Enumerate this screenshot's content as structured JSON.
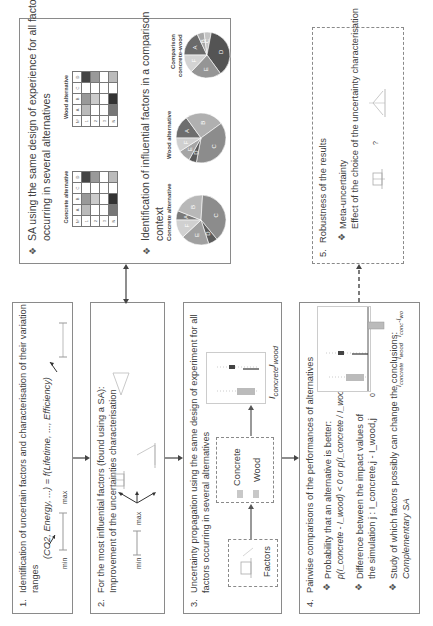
{
  "steps": [
    {
      "number": "1.",
      "title_line1": "Identification of uncertain factors and characterisation of their variation",
      "title_line2": "ranges",
      "formula": "(CO2, Energy, ...) = f(Lifetime, ..., Efficiency)",
      "range_min": "min",
      "range_max": "max"
    },
    {
      "number": "2.",
      "title_line1": "For the most influential factors (found using a SA):",
      "title_line2": "Improvement of the uncertainties characterisation",
      "range_min": "min",
      "range_max": "max"
    },
    {
      "number": "3.",
      "title_line1": "Uncertainty propagation using the same design of experiment for all",
      "title_line2": "factors occurring in several alternatives",
      "factors_label": "Factors",
      "alternatives": [
        "Concrete",
        "Wood"
      ],
      "output_labels": [
        "I_concrete",
        "I_wood"
      ],
      "output_main": [
        "I",
        "I"
      ],
      "output_sub": [
        "concrete",
        "wood"
      ]
    },
    {
      "number": "4.",
      "title": "Pairwise comparisons of the performances of alternatives",
      "bullets": [
        {
          "line1": "Probability that an alternative is better:",
          "line2": "p(I_concrete - I_wood) < 0   or   p(I_concrete / I_wood) < 1"
        },
        {
          "line1": "Difference between the impact values of",
          "line2": "the simulation j : I_concrete,j - I_wood,j"
        },
        {
          "line1": "Study of which factors possibly can change the conclusions:",
          "line2": "Complementary SA"
        }
      ],
      "chart_zero": "0",
      "chart_labels": {
        "a_main": "I",
        "a_sub": "concrete",
        "b_main": "I",
        "b_sub": "wood",
        "c_main": "I",
        "c_sub1": "conc",
        "c_mid": "-I",
        "c_sub2": "wo"
      }
    },
    {
      "number": "5.",
      "title": "Robustness of the results",
      "bullet_line1": "Meta-uncertainty",
      "bullet_line2": "Effect of the choice of the uncertainty characterisation",
      "question": "?"
    }
  ],
  "sa_box": {
    "bullet1_line1": "SA using the same design of experience for all factors",
    "bullet1_line2": "occurring in several alternatives",
    "bullet2_line1": "Identification of influential factors in a comparison",
    "bullet2_line2": "context",
    "tables": [
      {
        "caption": "Concrete alternative",
        "header": [
          "N°",
          "A",
          "B",
          "C",
          "D"
        ],
        "rows": [
          [
            "1",
            "",
            "",
            "",
            ""
          ],
          [
            "2",
            "",
            "",
            "",
            ""
          ],
          [
            "3",
            "",
            "",
            "",
            ""
          ],
          [
            "4",
            "",
            "",
            "",
            ""
          ],
          [
            "N",
            "",
            "",
            "",
            ""
          ]
        ]
      },
      {
        "caption": "Wood alternative",
        "header": [
          "N°",
          "A",
          "B",
          "C",
          "D"
        ],
        "rows": [
          [
            "1",
            "",
            "",
            "",
            ""
          ],
          [
            "2",
            "",
            "",
            "",
            ""
          ],
          [
            "3",
            "",
            "",
            "",
            ""
          ],
          [
            "4",
            "",
            "",
            "",
            ""
          ],
          [
            "N",
            "",
            "",
            "",
            ""
          ]
        ]
      }
    ],
    "pies": [
      {
        "caption": "Concrete alternative",
        "slices": [
          {
            "label": "A",
            "value": 6,
            "color": "#7a7a7a"
          },
          {
            "label": "B",
            "value": 20,
            "color": "#b8b8b8"
          },
          {
            "label": "C",
            "value": 38,
            "color": "#8c8c8c"
          },
          {
            "label": "D",
            "value": 6,
            "color": "#5c5c5c"
          },
          {
            "label": "E",
            "value": 18,
            "color": "#a0a0a0"
          },
          {
            "label": "F",
            "value": 12,
            "color": "#d0d0d0"
          }
        ]
      },
      {
        "caption": "Wood alternative",
        "slices": [
          {
            "label": "A",
            "value": 15,
            "color": "#6e6e6e"
          },
          {
            "label": "B",
            "value": 25,
            "color": "#b0b0b0"
          },
          {
            "label": "C",
            "value": 38,
            "color": "#8c8c8c"
          },
          {
            "label": "D",
            "value": 5,
            "color": "#5a5a5a"
          },
          {
            "label": "E",
            "value": 8,
            "color": "#a5a5a5"
          },
          {
            "label": "F",
            "value": 9,
            "color": "#cfcfcf"
          }
        ]
      },
      {
        "caption_line1": "Comparison",
        "caption_line2": "concrete-wood",
        "slices": [
          {
            "label": "A",
            "value": 18,
            "color": "#6a6a6a"
          },
          {
            "label": "B",
            "value": 5,
            "color": "#a8a8a8"
          },
          {
            "label": "C",
            "value": 5,
            "color": "#c4c4c4"
          },
          {
            "label": "D",
            "value": 37,
            "color": "#545454"
          },
          {
            "label": "E",
            "value": 22,
            "color": "#959595"
          },
          {
            "label": "F",
            "value": 13,
            "color": "#d3d3d3"
          }
        ]
      }
    ]
  }
}
